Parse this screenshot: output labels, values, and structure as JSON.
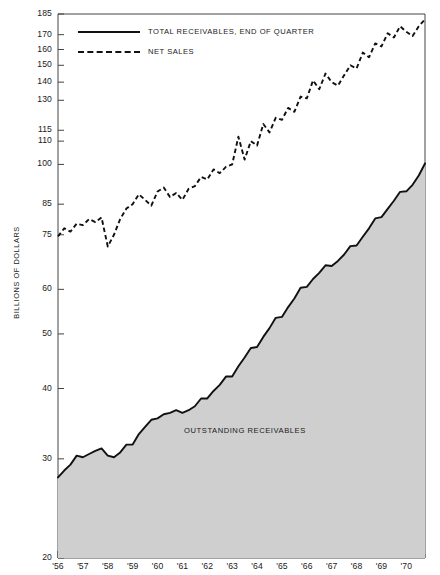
{
  "chart_data": {
    "type": "line",
    "title": "",
    "xlabel": "",
    "ylabel": "BILLIONS OF DOLLARS",
    "y_scale": "log",
    "ylim": [
      20,
      185
    ],
    "xlim": [
      1956.0,
      1970.75
    ],
    "grid": false,
    "legend_position": "top-left",
    "y_ticks": [
      20,
      30,
      40,
      50,
      60,
      75,
      85,
      100,
      110,
      115,
      130,
      140,
      150,
      160,
      170,
      185
    ],
    "y_tick_labels": [
      "20",
      "30",
      "40",
      "50",
      "60",
      "75",
      "85",
      "100",
      "110",
      "115",
      "130",
      "140",
      "150",
      "160",
      "170",
      "185"
    ],
    "x_ticks": [
      1956,
      1957,
      1958,
      1959,
      1960,
      1961,
      1962,
      1963,
      1964,
      1965,
      1966,
      1967,
      1968,
      1969,
      1970
    ],
    "x_tick_labels": [
      "'56",
      "'57",
      "'58",
      "'59",
      "'60",
      "'61",
      "'62",
      "'63",
      "'64",
      "'65",
      "'66",
      "'67",
      "'68",
      "'69",
      "'70"
    ],
    "annotations": [
      {
        "text": "OUTSTANDING RECEIVABLES",
        "x": 1963.4,
        "y": 33.5
      }
    ],
    "series": [
      {
        "name": "TOTAL RECEIVABLES, END OF QUARTER",
        "style": "solid",
        "color": "#111111",
        "fill": "#cfcfcf",
        "x": [
          1956.0,
          1956.25,
          1956.5,
          1956.75,
          1957.0,
          1957.25,
          1957.5,
          1957.75,
          1958.0,
          1958.25,
          1958.5,
          1958.75,
          1959.0,
          1959.25,
          1959.5,
          1959.75,
          1960.0,
          1960.25,
          1960.5,
          1960.75,
          1961.0,
          1961.25,
          1961.5,
          1961.75,
          1962.0,
          1962.25,
          1962.5,
          1962.75,
          1963.0,
          1963.25,
          1963.5,
          1963.75,
          1964.0,
          1964.25,
          1964.5,
          1964.75,
          1965.0,
          1965.25,
          1965.5,
          1965.75,
          1966.0,
          1966.25,
          1966.5,
          1966.75,
          1967.0,
          1967.25,
          1967.5,
          1967.75,
          1968.0,
          1968.25,
          1968.5,
          1968.75,
          1969.0,
          1969.25,
          1969.5,
          1969.75,
          1970.0,
          1970.25,
          1970.5,
          1970.75
        ],
        "y": [
          27.8,
          28.6,
          29.3,
          30.4,
          30.2,
          30.6,
          31.0,
          31.3,
          30.4,
          30.2,
          30.8,
          31.8,
          31.8,
          33.2,
          34.2,
          35.2,
          35.4,
          36.0,
          36.2,
          36.6,
          36.2,
          36.6,
          37.2,
          38.4,
          38.4,
          39.6,
          40.6,
          42.0,
          42.0,
          43.8,
          45.4,
          47.2,
          47.4,
          49.4,
          51.2,
          53.4,
          53.6,
          55.8,
          57.8,
          60.4,
          60.6,
          62.6,
          64.2,
          66.2,
          66.0,
          67.4,
          69.2,
          71.6,
          71.8,
          74.4,
          77.0,
          80.2,
          80.6,
          83.4,
          86.2,
          89.4,
          89.6,
          92.0,
          95.6,
          100.4
        ]
      },
      {
        "name": "NET SALES",
        "style": "dashed",
        "color": "#111111",
        "x": [
          1956.0,
          1956.25,
          1956.5,
          1956.75,
          1957.0,
          1957.25,
          1957.5,
          1957.75,
          1958.0,
          1958.25,
          1958.5,
          1958.75,
          1959.0,
          1959.25,
          1959.5,
          1959.75,
          1960.0,
          1960.25,
          1960.5,
          1960.75,
          1961.0,
          1961.25,
          1961.5,
          1961.75,
          1962.0,
          1962.25,
          1962.5,
          1962.75,
          1963.0,
          1963.25,
          1963.5,
          1963.75,
          1964.0,
          1964.25,
          1964.5,
          1964.75,
          1965.0,
          1965.25,
          1965.5,
          1965.75,
          1966.0,
          1966.25,
          1966.5,
          1966.75,
          1967.0,
          1967.25,
          1967.5,
          1967.75,
          1968.0,
          1968.25,
          1968.5,
          1968.75,
          1969.0,
          1969.25,
          1969.5,
          1969.75,
          1970.0,
          1970.25,
          1970.5,
          1970.75
        ],
        "y": [
          74.5,
          77.0,
          76.0,
          78.5,
          78.0,
          80.0,
          79.0,
          80.5,
          71.5,
          75.0,
          80.0,
          83.5,
          85.0,
          88.5,
          86.5,
          84.5,
          89.5,
          91.0,
          87.5,
          89.0,
          86.5,
          90.5,
          91.5,
          95.0,
          94.0,
          98.0,
          96.5,
          99.0,
          100.0,
          112.0,
          102.0,
          110.0,
          108.0,
          118.0,
          114.0,
          121.0,
          120.0,
          126.0,
          124.0,
          132.0,
          131.0,
          141.0,
          136.0,
          145.0,
          140.0,
          138.0,
          144.0,
          150.0,
          148.0,
          158.0,
          155.0,
          164.0,
          162.0,
          171.0,
          168.0,
          176.0,
          172.0,
          169.0,
          176.0,
          181.0
        ]
      }
    ]
  },
  "legend": {
    "items": [
      {
        "label": "TOTAL RECEIVABLES, END OF QUARTER",
        "style": "solid"
      },
      {
        "label": "NET SALES",
        "style": "dashed"
      }
    ]
  },
  "axis_title": {
    "y": "BILLIONS OF DOLLARS"
  },
  "annotation": {
    "outstanding": "OUTSTANDING RECEIVABLES"
  }
}
